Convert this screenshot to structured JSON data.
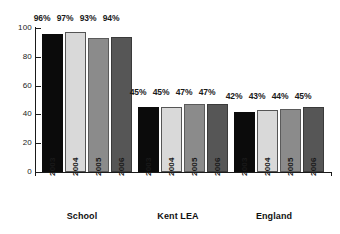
{
  "chart_data": {
    "type": "bar",
    "title": "",
    "subtitle": "",
    "xlabel": "",
    "ylabel": "",
    "ylim": [
      0,
      100
    ],
    "yticks": [
      0,
      20,
      40,
      60,
      80,
      100
    ],
    "ytick_labels": [
      "0",
      "20",
      "40",
      "60",
      "80",
      "100"
    ],
    "grid": false,
    "legend": "none",
    "categories": [
      "School",
      "Kent LEA",
      "England"
    ],
    "series": [
      {
        "name": "2003",
        "values": [
          96,
          45,
          42
        ],
        "color": "#0b0b0b"
      },
      {
        "name": "2004",
        "values": [
          97,
          45,
          43
        ],
        "color": "#d9d9d9"
      },
      {
        "name": "2005",
        "values": [
          93,
          47,
          44
        ],
        "color": "#8b8b8b"
      },
      {
        "name": "2006",
        "values": [
          94,
          47,
          45
        ],
        "color": "#565656"
      }
    ],
    "data_labels": [
      [
        "96%",
        "97%",
        "93%",
        "94%"
      ],
      [
        "45%",
        "45%",
        "47%",
        "47%"
      ],
      [
        "42%",
        "43%",
        "44%",
        "45%"
      ]
    ],
    "annotations": []
  },
  "axis": {
    "y": {
      "t100": "100",
      "t80": "80",
      "t60": "60",
      "t40": "40",
      "t20": "20",
      "t0": "0"
    }
  },
  "groups": [
    {
      "label": "School",
      "years": [
        "2003",
        "2004",
        "2005",
        "2006"
      ],
      "values": [
        96,
        97,
        93,
        94
      ],
      "labels": [
        "96%",
        "97%",
        "93%",
        "94%"
      ]
    },
    {
      "label": "Kent LEA",
      "years": [
        "2003",
        "2004",
        "2005",
        "2006"
      ],
      "values": [
        45,
        45,
        47,
        47
      ],
      "labels": [
        "45%",
        "45%",
        "47%",
        "47%"
      ]
    },
    {
      "label": "England",
      "years": [
        "2003",
        "2004",
        "2005",
        "2006"
      ],
      "values": [
        42,
        43,
        44,
        45
      ],
      "labels": [
        "42%",
        "43%",
        "44%",
        "45%"
      ]
    }
  ]
}
